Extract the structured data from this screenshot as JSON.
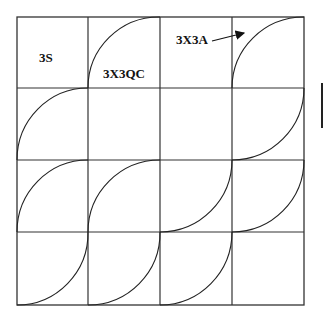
{
  "diagram": {
    "type": "tiling-grid",
    "rows": 4,
    "cols": 4,
    "labels": {
      "cell_label": "3S",
      "curve_label": "3X3QC",
      "arrow_label": "3X3A"
    },
    "colors": {
      "line": "#333333",
      "background": "#ffffff",
      "text": "#111111"
    }
  }
}
